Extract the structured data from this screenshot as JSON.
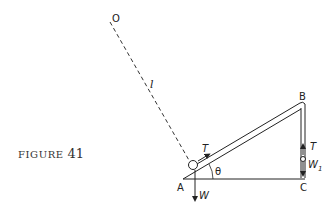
{
  "figure": {
    "caption_word": "FIGURE",
    "caption_number": "41"
  },
  "labels": {
    "O": "O",
    "l": "l",
    "A": "A",
    "B": "B",
    "C": "C",
    "theta": "θ",
    "T_ring": "T",
    "T_weight": "T",
    "W": "W",
    "W1_main": "W",
    "W1_sub": "1"
  },
  "colors": {
    "ink": "#222222",
    "background": "#ffffff"
  }
}
